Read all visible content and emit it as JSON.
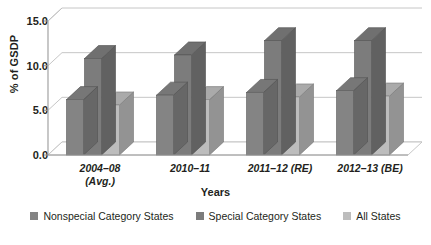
{
  "chart_data": {
    "type": "bar",
    "title": "",
    "subtitle": "",
    "xlabel": "Years",
    "ylabel": "% of GSDP",
    "categories": [
      "2004–08\n(Avg.)",
      "2010–11",
      "2011–12 (RE)",
      "2012–13 (BE)"
    ],
    "series": [
      {
        "name": "Nonspecial Category States",
        "color": "#848484",
        "values": [
          6.2,
          6.7,
          7.0,
          7.2
        ]
      },
      {
        "name": "Special Category States",
        "color": "#7c7c7c",
        "values": [
          10.8,
          11.2,
          12.8,
          12.8
        ]
      },
      {
        "name": "All States",
        "color": "#bdbdbd",
        "values": [
          5.6,
          6.2,
          6.5,
          6.6
        ]
      }
    ],
    "ylim": [
      0.0,
      15.0
    ],
    "yticks": [
      "0.0",
      "5.0",
      "10.0",
      "15.0"
    ],
    "ytick_values": [
      0.0,
      5.0,
      10.0,
      15.0
    ],
    "grid": true,
    "legend_position": "bottom",
    "style": "3d-column"
  },
  "legend": {
    "items": [
      {
        "label": "Nonspecial Category States",
        "color": "#848484"
      },
      {
        "label": "Special Category States",
        "color": "#7c7c7c"
      },
      {
        "label": "All States",
        "color": "#bdbdbd"
      }
    ]
  },
  "colors": {
    "axis": "#9a9a9a",
    "grid": "#bfbfbf",
    "text": "#231f20",
    "background": "#ffffff",
    "floor": "#ffffff"
  }
}
